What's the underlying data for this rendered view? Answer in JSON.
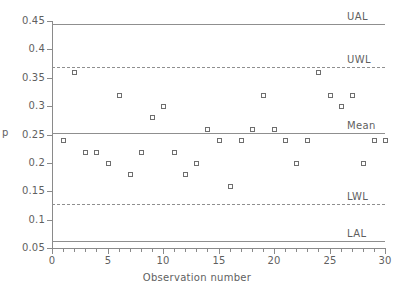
{
  "chart_data": {
    "type": "scatter",
    "title": "",
    "xlabel": "Observation number",
    "ylabel": "p",
    "xlim": [
      0,
      30
    ],
    "ylim": [
      0.05,
      0.45
    ],
    "grid": false,
    "legend_position": "right-inline",
    "x_ticks": [
      0,
      5,
      10,
      15,
      20,
      25,
      30
    ],
    "x_tick_labels": [
      "0",
      "5",
      "10",
      "15",
      "20",
      "25",
      "30"
    ],
    "y_ticks": [
      0.05,
      0.1,
      0.15,
      0.2,
      0.25,
      0.3,
      0.35,
      0.4,
      0.45
    ],
    "y_tick_labels": [
      "0.05",
      "0.1",
      "0.15",
      "0.2",
      "0.25",
      "0.3",
      "0.35",
      "0.4",
      "0.45"
    ],
    "x": [
      1,
      2,
      3,
      4,
      5,
      6,
      7,
      8,
      9,
      10,
      11,
      12,
      13,
      14,
      15,
      16,
      17,
      18,
      19,
      20,
      21,
      22,
      23,
      24,
      25,
      26,
      27,
      28,
      29,
      30
    ],
    "values": [
      0.24,
      0.36,
      0.22,
      0.22,
      0.2,
      0.32,
      0.18,
      0.22,
      0.28,
      0.3,
      0.22,
      0.18,
      0.2,
      0.26,
      0.24,
      0.16,
      0.24,
      0.26,
      0.32,
      0.26,
      0.24,
      0.2,
      0.24,
      0.36,
      0.32,
      0.3,
      0.32,
      0.2,
      0.24,
      0.24
    ],
    "series_name": "p",
    "control_limits": [
      {
        "key": "ual",
        "label": "UAL",
        "value": 0.4447
      },
      {
        "key": "uwl",
        "label": "UWL",
        "value": 0.3696,
        "dashed": true
      },
      {
        "key": "mean",
        "label": "Mean",
        "value": 0.2527
      },
      {
        "key": "lwl",
        "label": "LWL",
        "value": 0.1283,
        "dashed": true
      },
      {
        "key": "lal",
        "label": "LAL",
        "value": 0.0629
      }
    ]
  }
}
